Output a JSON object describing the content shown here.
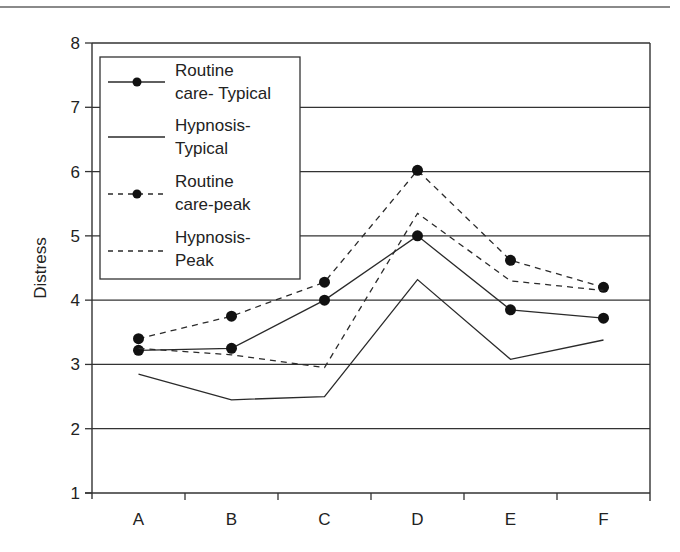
{
  "chart_data": {
    "type": "line",
    "title": "",
    "xlabel": "",
    "ylabel": "Distress",
    "ylim": [
      1,
      8
    ],
    "yticks": [
      1,
      2,
      3,
      4,
      5,
      6,
      7,
      8
    ],
    "grid": "horizontal",
    "legend_position": "upper-left (inside)",
    "categories": [
      "A",
      "B",
      "C",
      "D",
      "E",
      "F"
    ],
    "series": [
      {
        "name": "Routine care- Typical",
        "style": "solid",
        "marker": "filled-circle",
        "values": [
          3.22,
          3.25,
          4.0,
          5.0,
          3.85,
          3.72
        ]
      },
      {
        "name": "Hypnosis- Typical",
        "style": "solid",
        "marker": "none",
        "values": [
          2.85,
          2.45,
          2.5,
          4.32,
          3.08,
          3.38
        ]
      },
      {
        "name": "Routine care-peak",
        "style": "dashed",
        "marker": "filled-circle",
        "values": [
          3.4,
          3.75,
          4.28,
          6.02,
          4.62,
          4.2
        ]
      },
      {
        "name": "Hypnosis- Peak",
        "style": "dashed",
        "marker": "none",
        "values": [
          3.25,
          3.15,
          2.95,
          5.35,
          4.3,
          4.15
        ]
      }
    ]
  },
  "legend": {
    "items": [
      {
        "line1": "Routine",
        "line2": "care- Typical"
      },
      {
        "line1": "Hypnosis-",
        "line2": "Typical"
      },
      {
        "line1": "Routine",
        "line2": "care-peak"
      },
      {
        "line1": "Hypnosis-",
        "line2": "Peak"
      }
    ]
  },
  "colors": {
    "line": "#2a2a2a",
    "axis": "#333333",
    "grid": "#333333",
    "top_rule": "#8a8a8a"
  }
}
